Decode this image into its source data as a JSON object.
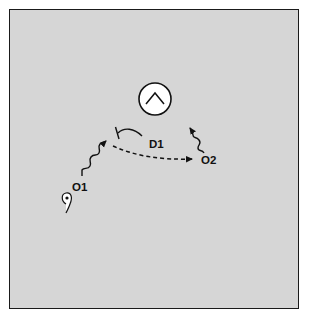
{
  "diagram": {
    "type": "signaling-schematic",
    "background_color": "#d6d6d6",
    "border_color": "#1a1a1a",
    "nodes": [
      {
        "id": "target",
        "label": "",
        "shape": "circle",
        "glyph": "caret-up",
        "description": "circular target symbol with upward chevron"
      },
      {
        "id": "D1",
        "label": "D1"
      },
      {
        "id": "O1",
        "label": "O1"
      },
      {
        "id": "O2",
        "label": "O2"
      },
      {
        "id": "source",
        "label": "",
        "shape": "teardrop-cell",
        "description": "small cell with nucleus and tail"
      }
    ],
    "edges": [
      {
        "from": "O1",
        "to": "D1-junction",
        "style": "wavy-arrow"
      },
      {
        "from": "D1",
        "to": "D1-junction",
        "style": "inhibition-bar",
        "note": "curved T-bar"
      },
      {
        "from": "D1-junction",
        "to": "O2",
        "style": "dashed-arrow"
      },
      {
        "from": "O2",
        "to": "target",
        "style": "wavy-arrow"
      }
    ],
    "labels": {
      "d1": "D1",
      "o1": "O1",
      "o2": "O2"
    }
  }
}
